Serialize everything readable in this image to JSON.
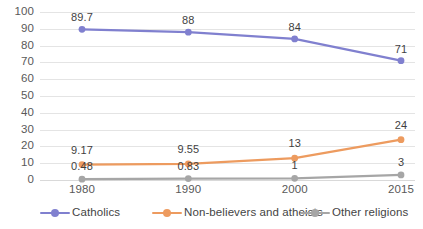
{
  "chart_data": {
    "type": "line",
    "title": "",
    "subtitle": "",
    "xlabel": "",
    "ylabel": "",
    "categories": [
      "1980",
      "1990",
      "2000",
      "2015"
    ],
    "ylim": [
      0,
      100
    ],
    "y_ticks": [
      "0",
      "10",
      "20",
      "30",
      "40",
      "50",
      "60",
      "70",
      "80",
      "90",
      "100"
    ],
    "grid": true,
    "legend_position": "bottom",
    "series": [
      {
        "name": "Catholics",
        "color": "#8democratic",
        "values": [
          89.7,
          88,
          84,
          71
        ],
        "labels": [
          "89.7",
          "88",
          "84",
          "71"
        ]
      },
      {
        "name": "Non-believers and atheists",
        "color": "#ed9b5f",
        "values": [
          9.17,
          9.55,
          13,
          24
        ],
        "labels": [
          "9.17",
          "9.55",
          "13",
          "24"
        ]
      },
      {
        "name": "Other religions",
        "color": "#a6a6a6",
        "values": [
          0.48,
          0.83,
          1,
          3
        ],
        "labels": [
          "0.48",
          "0.83",
          "1",
          "3"
        ]
      }
    ]
  },
  "colors": {
    "catholics": "#8080cf",
    "nonbelievers": "#ed9b5f",
    "other": "#a6a6a6",
    "gridline": "#e4e4e4",
    "axis_text": "#595959",
    "label_text": "#3f3f3f"
  },
  "legend": {
    "items": [
      {
        "label": "Catholics",
        "marker": "line-with-circle-marker"
      },
      {
        "label": "Non-believers and atheists",
        "marker": "line-with-circle-marker"
      },
      {
        "label": "Other religions",
        "marker": "line-with-circle-marker"
      }
    ]
  }
}
